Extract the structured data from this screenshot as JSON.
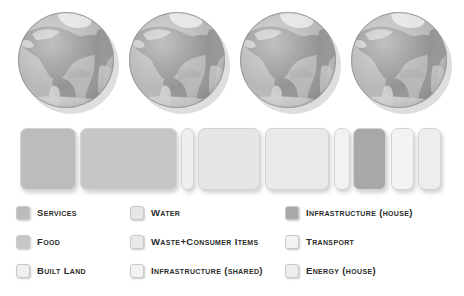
{
  "globes": {
    "icon": "earth-globe-icon",
    "count": 4,
    "items": [
      {
        "label": "Planet 1",
        "clipped": false,
        "left": 14
      },
      {
        "label": "Planet 2",
        "clipped": false,
        "left": 125
      },
      {
        "label": "Planet 3",
        "clipped": false,
        "left": 236
      },
      {
        "label": "Planet 4",
        "clipped": true,
        "left": 347
      }
    ],
    "colors": {
      "ocean": "#b4b4b4",
      "land": "#8e8e8e",
      "land_light": "#d2d2d2",
      "ice": "#e2e2e2",
      "outline": "#9a9a9a"
    }
  },
  "chart_data": {
    "type": "bar",
    "orientation": "horizontal-stacked",
    "title": "",
    "xlabel": "",
    "ylabel": "",
    "grid": false,
    "legend_position": "bottom",
    "categories": [
      "Services",
      "Food",
      "Built Land",
      "Water",
      "Waste+Consumer Items",
      "Infrastructure (shared)",
      "Infrastructure (house)",
      "Transport",
      "Energy (house)"
    ],
    "segments": [
      {
        "name": "Services",
        "left": 20,
        "width": 56,
        "color": "#bcbcbc"
      },
      {
        "name": "Food",
        "left": 80,
        "width": 97,
        "color": "#c6c6c6"
      },
      {
        "name": "Built Land",
        "left": 181,
        "width": 13,
        "color": "#efefef"
      },
      {
        "name": "Water",
        "left": 198,
        "width": 62,
        "color": "#e6e6e6"
      },
      {
        "name": "Waste+Consumer Items",
        "left": 265,
        "width": 64,
        "color": "#e9e9e9"
      },
      {
        "name": "Infrastructure (shared)",
        "left": 334,
        "width": 16,
        "color": "#f2f2f2"
      },
      {
        "name": "Infrastructure (house)",
        "left": 353,
        "width": 33,
        "color": "#a8a8a8"
      },
      {
        "name": "Transport",
        "left": 391,
        "width": 23,
        "color": "#f3f3f3"
      },
      {
        "name": "Energy (house)",
        "left": 418,
        "width": 23,
        "color": "#ededed"
      }
    ],
    "values": [
      56,
      97,
      13,
      62,
      64,
      16,
      33,
      23,
      23
    ]
  },
  "legend": {
    "columns": [
      {
        "id": "col-1",
        "items": [
          {
            "label": "Services",
            "swatch": "#bcbcbc"
          },
          {
            "label": "Food",
            "swatch": "#c6c6c6"
          },
          {
            "label": "Built Land",
            "swatch": "#efefef"
          }
        ]
      },
      {
        "id": "col-2",
        "items": [
          {
            "label": "Water",
            "swatch": "#e6e6e6"
          },
          {
            "label": "Waste+Consumer Items",
            "swatch": "#e9e9e9"
          },
          {
            "label": "Infrastructure (shared)",
            "swatch": "#f2f2f2"
          }
        ]
      },
      {
        "id": "col-3",
        "items": [
          {
            "label": "Infrastructure (house)",
            "swatch": "#a8a8a8"
          },
          {
            "label": "Transport",
            "swatch": "#f3f3f3"
          },
          {
            "label": "Energy (house)",
            "swatch": "#ededed"
          }
        ]
      }
    ]
  }
}
